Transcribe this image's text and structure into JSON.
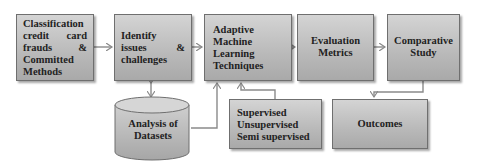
{
  "diagram": {
    "type": "flowchart",
    "nodes": [
      {
        "id": "n1",
        "lines": [
          "Classification",
          "credit card",
          "frauds &",
          "Committed",
          "Methods"
        ]
      },
      {
        "id": "n2",
        "lines": [
          "Identify",
          "issues &",
          "challenges"
        ]
      },
      {
        "id": "n3",
        "lines": [
          "Adaptive",
          "Machine",
          "Learning",
          "Techniques"
        ]
      },
      {
        "id": "n4",
        "lines": [
          "Evaluation",
          "Metrics"
        ]
      },
      {
        "id": "n5",
        "lines": [
          "Comparative",
          "Study"
        ]
      },
      {
        "id": "n6",
        "shape": "cylinder",
        "lines": [
          "Analysis of",
          "Datasets"
        ]
      },
      {
        "id": "n7",
        "lines": [
          "Supervised",
          "Unsupervised",
          "Semi supervised"
        ]
      },
      {
        "id": "n8",
        "lines": [
          "Outcomes"
        ]
      }
    ],
    "edges": [
      {
        "from": "n1",
        "to": "n2"
      },
      {
        "from": "n2",
        "to": "n3"
      },
      {
        "from": "n3",
        "to": "n4"
      },
      {
        "from": "n4",
        "to": "n5"
      },
      {
        "from": "n2",
        "to": "n6",
        "bidirectional": true
      },
      {
        "from": "n6",
        "to": "n3"
      },
      {
        "from": "n7",
        "to": "n3"
      },
      {
        "from": "n5",
        "to": "n8"
      }
    ],
    "colors": {
      "box_fill_top": "#d4d4d4",
      "box_fill_bottom": "#a9a9a9",
      "border": "#6f6f6f",
      "arrow": "#8a8a8a"
    }
  }
}
